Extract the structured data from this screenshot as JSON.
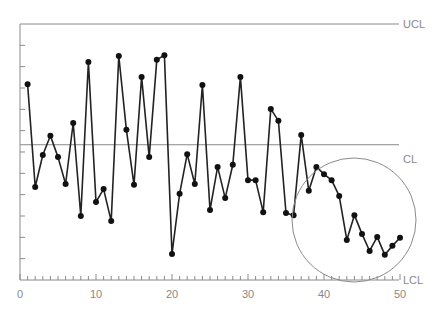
{
  "chart_data": {
    "type": "line",
    "title": "",
    "subtitle": "",
    "xlabel": "",
    "ylabel": "",
    "x_ticks": [
      0,
      10,
      20,
      30,
      40,
      50
    ],
    "xlim": [
      0,
      50
    ],
    "ylim": [
      -3,
      3
    ],
    "grid": false,
    "legend": null,
    "control_lines": [
      {
        "name": "UCL",
        "value": 3
      },
      {
        "name": "CL",
        "value": 0.17
      },
      {
        "name": "LCL",
        "value": -3
      }
    ],
    "annotations": [
      {
        "type": "circle",
        "label": "",
        "center_x": 44.5,
        "center_y": -1.5,
        "note": "highlights downward run of points 38–50"
      }
    ],
    "series": [
      {
        "name": "samples",
        "x": [
          1,
          2,
          3,
          4,
          5,
          6,
          7,
          8,
          9,
          10,
          11,
          12,
          13,
          14,
          15,
          16,
          17,
          18,
          19,
          20,
          21,
          22,
          23,
          24,
          25,
          26,
          27,
          28,
          29,
          30,
          31,
          32,
          33,
          34,
          35,
          36,
          37,
          38,
          39,
          40,
          41,
          42,
          43,
          44,
          45,
          46,
          47,
          48,
          49,
          50
        ],
        "values": [
          1.59,
          -0.82,
          -0.07,
          0.38,
          -0.12,
          -0.75,
          0.68,
          -1.5,
          2.11,
          -1.17,
          -0.87,
          -1.62,
          2.25,
          0.52,
          -0.77,
          1.76,
          -0.12,
          2.16,
          2.27,
          -2.39,
          -0.98,
          -0.05,
          -0.75,
          1.57,
          -1.36,
          -0.35,
          -1.08,
          -0.3,
          1.76,
          -0.66,
          -0.66,
          -1.41,
          1.01,
          0.73,
          -1.43,
          -1.48,
          0.4,
          -0.91,
          -0.35,
          -0.52,
          -0.66,
          -1.03,
          -2.06,
          -1.48,
          -1.92,
          -2.32,
          -1.99,
          -2.41,
          -2.2,
          -2.01
        ]
      }
    ],
    "axis_labels_right": [
      "UCL",
      "CL",
      "LCL"
    ]
  },
  "labels": {
    "ucl": "UCL",
    "cl": "CL",
    "lcl": "LCL",
    "x0": "0",
    "x10": "10",
    "x20": "20",
    "x30": "30",
    "x40": "40",
    "x50": "50"
  }
}
